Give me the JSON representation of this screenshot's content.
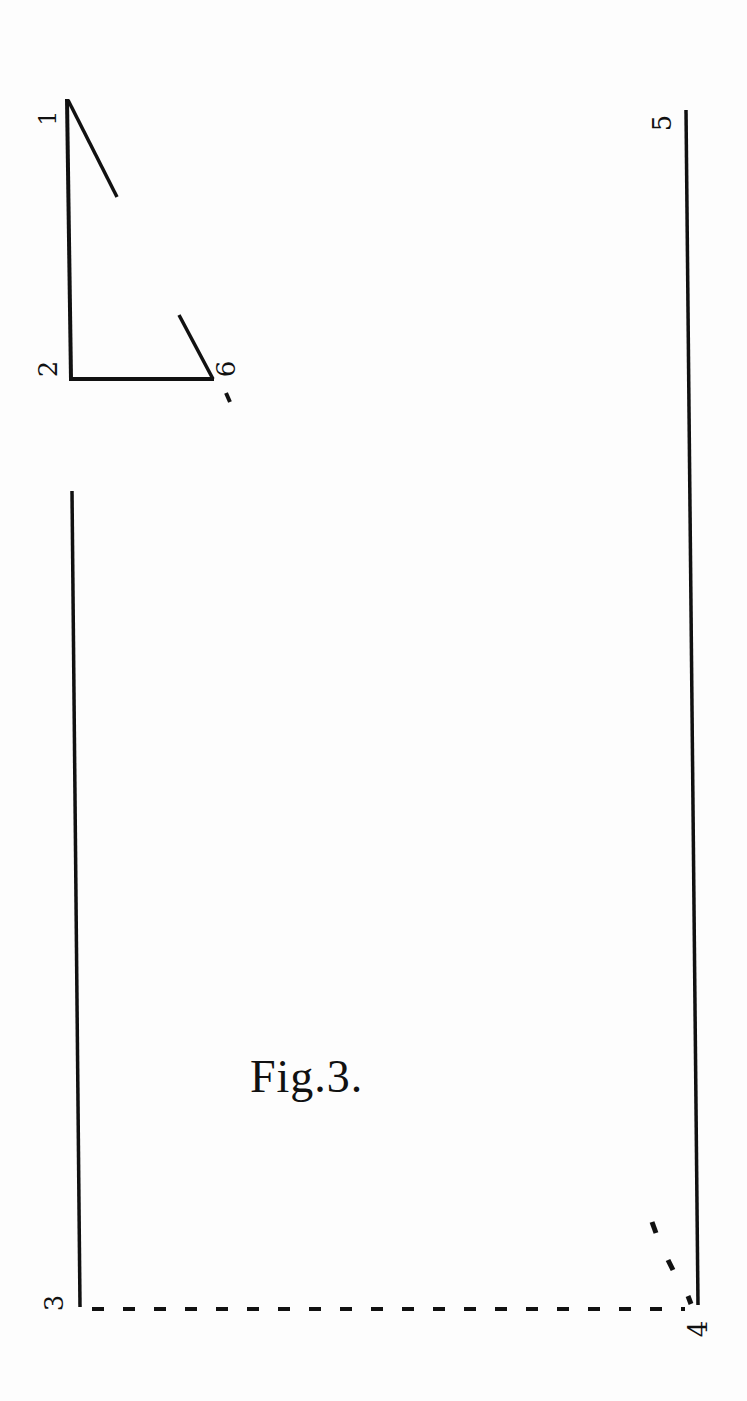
{
  "figure": {
    "caption": "Fig.3.",
    "stroke_color": "#111111",
    "background_color": "#fdfdfd"
  },
  "labels": {
    "p1": "1",
    "p2": "2",
    "p3": "3",
    "p4": "4",
    "p5": "5",
    "p6": "6"
  },
  "geometry": {
    "small_triangle": {
      "vertical": {
        "from": [
          67,
          99
        ],
        "to": [
          71,
          379
        ]
      },
      "base": {
        "from": [
          71,
          379
        ],
        "to": [
          213,
          379
        ]
      },
      "hypotenuse_top_segment": {
        "from": [
          67,
          99
        ],
        "to": [
          117,
          197
        ]
      },
      "hypotenuse_bottom_segment": {
        "from": [
          179,
          315
        ],
        "to": [
          213,
          379
        ]
      }
    },
    "large_figure": {
      "left_vertical": {
        "from": [
          72,
          491
        ],
        "to": [
          80,
          1307
        ]
      },
      "right_vertical": {
        "from": [
          686,
          110
        ],
        "to": [
          698,
          1305
        ]
      },
      "base_dashed": {
        "from": [
          80,
          1309
        ],
        "to": [
          690,
          1309
        ]
      },
      "diagonal_ticks": [
        [
          655,
          1228
        ],
        [
          670,
          1265
        ],
        [
          690,
          1300
        ]
      ]
    }
  }
}
